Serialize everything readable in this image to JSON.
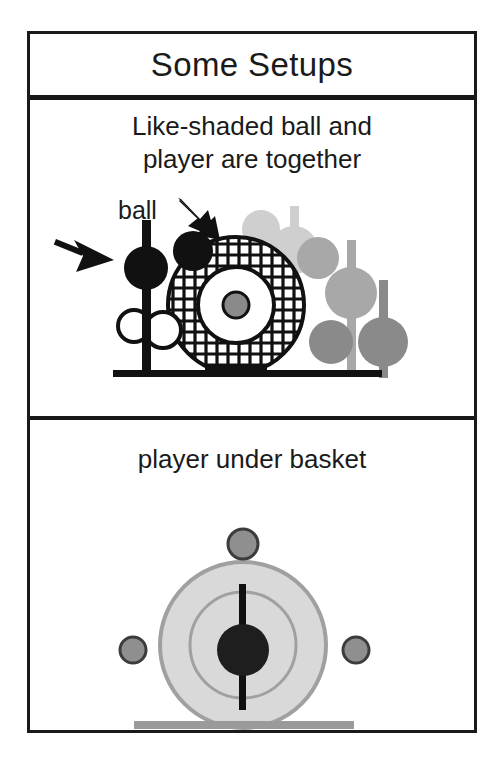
{
  "figure": {
    "title": "Some Setups"
  },
  "panels": [
    {
      "id": "like-shaded",
      "caption_line1": "Like-shaded ball and",
      "caption_line2": "player are together",
      "annotations": [
        {
          "id": "ball-label",
          "text": "ball"
        }
      ]
    },
    {
      "id": "player-under-basket",
      "caption": "player under basket"
    }
  ],
  "colors": {
    "ink": "#1a1a1a",
    "black": "#111111",
    "white": "#ffffff",
    "gray_light": "#cfcfcf",
    "gray_mid": "#a8a8a8",
    "gray_dark": "#8a8a8a",
    "gray_darker": "#777777",
    "basket_fill": "#d9d9d9",
    "basket_stroke": "#a0a0a0",
    "floor": "#9a9a9a",
    "ball_gray": "#8f8f8f",
    "ball_outline": "#3c3c3c"
  },
  "scene_top": {
    "description": "Players drawn as vertical bars with a ball-circle; matching shades pair ball with player. Hatched ring is the basket seen edge-on.",
    "floor": {
      "x1": 83,
      "y1": 196,
      "x2": 352,
      "y2": 196
    },
    "basket": {
      "cx": 206,
      "cy": 127,
      "r_outer": 68,
      "r_inner": 38,
      "r_hub": 13,
      "hatch": "cross-hatch",
      "stroke": "#111111"
    },
    "basket_base": {
      "x": 175,
      "y": 186,
      "w": 62,
      "h": 11
    },
    "players": [
      {
        "id": "p-black",
        "shade": "#111111",
        "bar_x": 112,
        "bar_top": 42,
        "bar_bottom": 196,
        "bar_w": 9,
        "ball_cx": 116,
        "ball_cy": 90,
        "ball_r": 22
      },
      {
        "id": "p-lightgray",
        "shade": "#cfcfcf",
        "bar_x": 260,
        "bar_top": 28,
        "bar_bottom": 148,
        "bar_w": 9,
        "ball_cx": 264,
        "ball_cy": 72,
        "ball_r": 24
      },
      {
        "id": "p-midgray",
        "shade": "#a8a8a8",
        "bar_x": 317,
        "bar_top": 62,
        "bar_bottom": 196,
        "bar_w": 9,
        "ball_cx": 321,
        "ball_cy": 115,
        "ball_r": 26
      },
      {
        "id": "p-darkgray",
        "shade": "#8a8a8a",
        "bar_x": 349,
        "bar_top": 102,
        "bar_bottom": 200,
        "bar_w": 9,
        "ball_cx": 353,
        "ball_cy": 164,
        "ball_r": 25
      }
    ],
    "balls": [
      {
        "id": "ball-black",
        "shade": "#111111",
        "cx": 163,
        "cy": 73,
        "r": 20
      },
      {
        "id": "ball-lightgray",
        "shade": "#cfcfcf",
        "cx": 231,
        "cy": 51,
        "r": 19
      },
      {
        "id": "ball-midgray",
        "shade": "#a8a8a8",
        "cx": 288,
        "cy": 80,
        "r": 21
      },
      {
        "id": "ball-darkgray",
        "shade": "#8a8a8a",
        "cx": 301,
        "cy": 164,
        "r": 22
      },
      {
        "id": "ball-white-a",
        "shade": "#ffffff",
        "cx": 104,
        "cy": 148,
        "r": 16,
        "outlined": true
      },
      {
        "id": "ball-white-b",
        "shade": "#ffffff",
        "cx": 133,
        "cy": 152,
        "r": 18,
        "outlined": true
      }
    ],
    "arrows": [
      {
        "id": "arrow-to-ball",
        "from": [
          152,
          25
        ],
        "to": [
          186,
          60
        ]
      },
      {
        "id": "arrow-to-player",
        "from": [
          28,
          63
        ],
        "to": [
          78,
          85
        ]
      }
    ]
  },
  "scene_bottom": {
    "description": "Basket seen from above as light gray disc with inner ring; black player stands at center; three gray balls around.",
    "basket": {
      "cx": 213,
      "cy": 167,
      "r_outer": 83,
      "r_inner": 53
    },
    "player": {
      "shade": "#111111",
      "bar_x": 209,
      "bar_top": 106,
      "bar_bottom": 232,
      "bar_w": 7,
      "ball_cx": 213,
      "ball_cy": 172,
      "ball_r": 26
    },
    "floor": {
      "x": 104,
      "y": 243,
      "w": 220,
      "h": 8
    },
    "balls": [
      {
        "id": "ball-top",
        "cx": 213,
        "cy": 66,
        "r": 15
      },
      {
        "id": "ball-left",
        "cx": 103,
        "cy": 172,
        "r": 13
      },
      {
        "id": "ball-right",
        "cx": 326,
        "cy": 172,
        "r": 13
      }
    ]
  }
}
